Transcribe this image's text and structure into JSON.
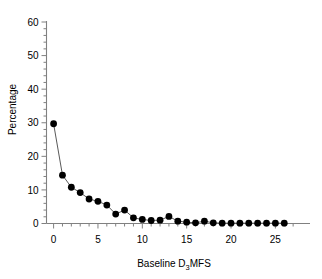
{
  "chart_data": {
    "type": "line",
    "title": "",
    "subtitle": "",
    "xlabel_prefix": "Baseline D",
    "xlabel_sub": "3",
    "xlabel_suffix": "MFS",
    "xlabel": "Baseline D3MFS",
    "ylabel": "Percentage",
    "xlim": [
      -0.8,
      28
    ],
    "ylim": [
      0,
      60
    ],
    "xticks": [
      0,
      5,
      10,
      15,
      20,
      25
    ],
    "xtick_labels": [
      "0",
      "5",
      "10",
      "15",
      "20",
      "25"
    ],
    "xminor_step": 1,
    "yticks": [
      0,
      10,
      20,
      30,
      40,
      50,
      60
    ],
    "ytick_labels": [
      "0",
      "10",
      "20",
      "30",
      "40",
      "50",
      "60"
    ],
    "yminor_step": 2,
    "grid": false,
    "legend": null,
    "marker": "filled-circle",
    "marker_color": "#000000",
    "line_color": "#595959",
    "axis_color": "#808080",
    "x": [
      0,
      1,
      2,
      3,
      4,
      5,
      6,
      7,
      8,
      9,
      10,
      11,
      12,
      13,
      14,
      15,
      16,
      17,
      18,
      19,
      20,
      21,
      22,
      23,
      24,
      25,
      26
    ],
    "values": [
      29.7,
      14.4,
      10.8,
      9.2,
      7.3,
      6.6,
      5.5,
      2.8,
      4.0,
      1.7,
      1.2,
      0.9,
      1.0,
      2.1,
      0.7,
      0.4,
      0.2,
      0.7,
      0.2,
      0.1,
      0.1,
      0.1,
      0.1,
      0.1,
      0.1,
      0.1,
      0.1
    ]
  }
}
